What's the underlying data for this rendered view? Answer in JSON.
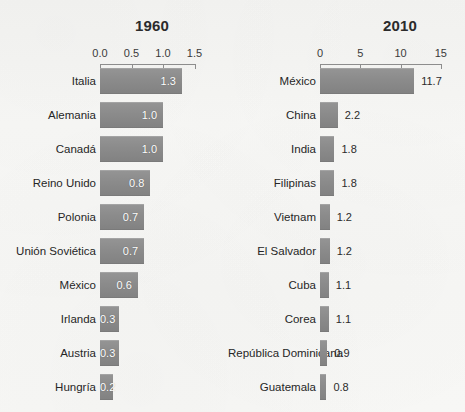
{
  "background_color": "#f7f7f5",
  "bar_color": "#8b8b8b",
  "charts": [
    {
      "id": "chart-1960",
      "title": "1960",
      "axis": {
        "ticks": [
          "0.0",
          "0.5",
          "1.0",
          "1.5"
        ],
        "tick_values": [
          0.0,
          0.5,
          1.0,
          1.5
        ],
        "min": 0.0,
        "max": 1.5
      },
      "value_label_position": "inside",
      "rows": [
        {
          "label": "Italia",
          "value": 1.3,
          "value_label": "1.3"
        },
        {
          "label": "Alemania",
          "value": 1.0,
          "value_label": "1.0"
        },
        {
          "label": "Canadá",
          "value": 1.0,
          "value_label": "1.0"
        },
        {
          "label": "Reino Unido",
          "value": 0.8,
          "value_label": "0.8"
        },
        {
          "label": "Polonia",
          "value": 0.7,
          "value_label": "0.7"
        },
        {
          "label": "Unión Soviética",
          "value": 0.7,
          "value_label": "0.7"
        },
        {
          "label": "México",
          "value": 0.6,
          "value_label": "0.6"
        },
        {
          "label": "Irlanda",
          "value": 0.3,
          "value_label": "0.3"
        },
        {
          "label": "Austria",
          "value": 0.3,
          "value_label": "0.3"
        },
        {
          "label": "Hungría",
          "value": 0.2,
          "value_label": "0.2"
        }
      ]
    },
    {
      "id": "chart-2010",
      "title": "2010",
      "axis": {
        "ticks": [
          "0",
          "5",
          "10",
          "15"
        ],
        "tick_values": [
          0,
          5,
          10,
          15
        ],
        "min": 0,
        "max": 15
      },
      "value_label_position": "outside",
      "rows": [
        {
          "label": "México",
          "value": 11.7,
          "value_label": "11.7"
        },
        {
          "label": "China",
          "value": 2.2,
          "value_label": "2.2"
        },
        {
          "label": "India",
          "value": 1.8,
          "value_label": "1.8"
        },
        {
          "label": "Filipinas",
          "value": 1.8,
          "value_label": "1.8"
        },
        {
          "label": "Vietnam",
          "value": 1.2,
          "value_label": "1.2"
        },
        {
          "label": "El Salvador",
          "value": 1.2,
          "value_label": "1.2"
        },
        {
          "label": "Cuba",
          "value": 1.1,
          "value_label": "1.1"
        },
        {
          "label": "Corea",
          "value": 1.1,
          "value_label": "1.1"
        },
        {
          "label": "República Dominicana",
          "value": 0.9,
          "value_label": "0.9"
        },
        {
          "label": "Guatemala",
          "value": 0.8,
          "value_label": "0.8"
        }
      ]
    }
  ],
  "chart_data": [
    {
      "type": "bar",
      "orientation": "horizontal",
      "title": "1960",
      "xlabel": "",
      "ylabel": "",
      "xlim": [
        0.0,
        1.5
      ],
      "grid": false,
      "legend": "none",
      "xticks": [
        0.0,
        0.5,
        1.0,
        1.5
      ],
      "xticklabels": [
        "0.0",
        "0.5",
        "1.0",
        "1.5"
      ],
      "categories": [
        "Italia",
        "Alemania",
        "Canadá",
        "Reino Unido",
        "Polonia",
        "Unión Soviética",
        "México",
        "Irlanda",
        "Austria",
        "Hungría"
      ],
      "values": [
        1.3,
        1.0,
        1.0,
        0.8,
        0.7,
        0.7,
        0.6,
        0.3,
        0.3,
        0.2
      ],
      "data_labels": [
        "1.3",
        "1.0",
        "1.0",
        "0.8",
        "0.7",
        "0.7",
        "0.6",
        "0.3",
        "0.3",
        "0.2"
      ]
    },
    {
      "type": "bar",
      "orientation": "horizontal",
      "title": "2010",
      "xlabel": "",
      "ylabel": "",
      "xlim": [
        0,
        15
      ],
      "grid": false,
      "legend": "none",
      "xticks": [
        0,
        5,
        10,
        15
      ],
      "xticklabels": [
        "0",
        "5",
        "10",
        "15"
      ],
      "categories": [
        "México",
        "China",
        "India",
        "Filipinas",
        "Vietnam",
        "El Salvador",
        "Cuba",
        "Corea",
        "República Dominicana",
        "Guatemala"
      ],
      "values": [
        11.7,
        2.2,
        1.8,
        1.8,
        1.2,
        1.2,
        1.1,
        1.1,
        0.9,
        0.8
      ],
      "data_labels": [
        "11.7",
        "2.2",
        "1.8",
        "1.8",
        "1.2",
        "1.2",
        "1.1",
        "1.1",
        "0.9",
        "0.8"
      ]
    }
  ]
}
